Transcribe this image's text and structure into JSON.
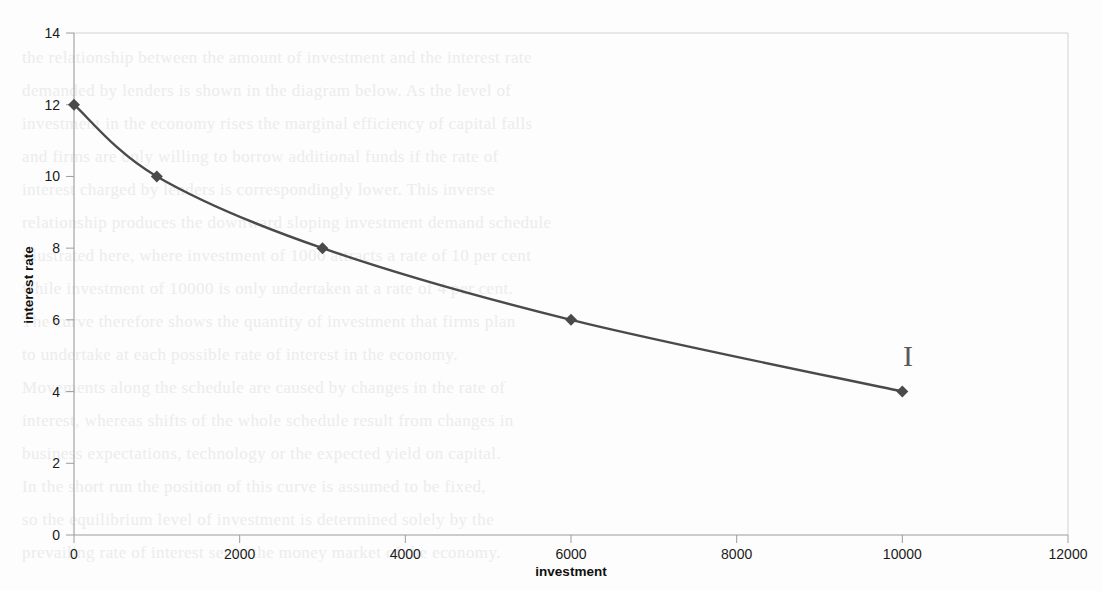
{
  "page": {
    "background_color": "#fdfdfd",
    "stray_mark": {
      "glyph": "I",
      "x": 908,
      "y": 366
    }
  },
  "ghost_text": {
    "note": "faint show-through text from the reverse of the scanned page",
    "color": "#ebebeb",
    "lines": [
      "the relationship between the amount of investment and the interest rate",
      "demanded by lenders is shown in the diagram below. As the level of",
      "investment in the economy rises the marginal efficiency of capital falls",
      "and firms are only willing to borrow additional funds if the rate of",
      "interest charged by lenders is correspondingly lower. This inverse",
      "relationship produces the downward sloping investment demand schedule",
      "illustrated here, where investment of 1000 attracts a rate of 10 per cent",
      "while investment of 10000 is only undertaken at a rate of 4 per cent.",
      "The curve therefore shows the quantity of investment that firms plan",
      "to undertake at each possible rate of interest in the economy.",
      "Movements along the schedule are caused by changes in the rate of",
      "interest, whereas shifts of the whole schedule result from changes in",
      "business expectations, technology or the expected yield on capital.",
      "In the short run the position of this curve is assumed to be fixed,",
      "so the equilibrium level of investment is determined solely by the",
      "prevailing rate of interest set in the money market of the economy."
    ]
  },
  "chart_data": {
    "type": "line",
    "title": "",
    "xlabel": "investment",
    "ylabel": "interest rate",
    "xlim": [
      0,
      12000
    ],
    "ylim": [
      0,
      14
    ],
    "xticks": [
      0,
      2000,
      4000,
      6000,
      8000,
      10000,
      12000
    ],
    "yticks": [
      0,
      2,
      4,
      6,
      8,
      10,
      12,
      14
    ],
    "xtick_labels": [
      "0",
      "2000",
      "4000",
      "6000",
      "8000",
      "10000",
      "12000"
    ],
    "ytick_labels": [
      "0",
      "2",
      "4",
      "6",
      "8",
      "10",
      "12",
      "14"
    ],
    "grid": false,
    "legend": "none",
    "series": [
      {
        "name": "investment demand schedule",
        "color": "#4a4a4a",
        "marker": "diamond",
        "marker_color": "#4a4a4a",
        "line_width": 2.4,
        "smoothed": true,
        "x": [
          0,
          1000,
          3000,
          6000,
          10000
        ],
        "y": [
          12,
          10,
          8,
          6,
          4
        ],
        "points": [
          {
            "x": 0,
            "y": 12
          },
          {
            "x": 1000,
            "y": 10
          },
          {
            "x": 3000,
            "y": 8
          },
          {
            "x": 6000,
            "y": 6
          },
          {
            "x": 10000,
            "y": 4
          }
        ]
      }
    ]
  },
  "colors": {
    "series_line": "#4a4a4a",
    "axis": "#a8a8a8",
    "frame": "#d2d2d2",
    "tick_text": "#1b1b1b",
    "axis_title_text": "#101010"
  }
}
